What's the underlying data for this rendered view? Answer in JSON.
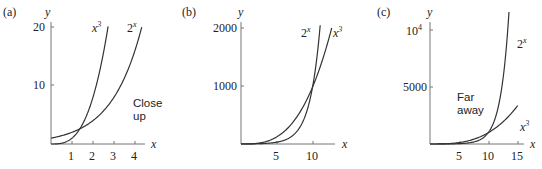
{
  "chart_data": [
    {
      "type": "line",
      "panel_label": "(a)",
      "title": "",
      "annotation": [
        "Close",
        "up"
      ],
      "xlabel": "x",
      "ylabel": "y",
      "xlim": [
        0,
        4.3
      ],
      "ylim": [
        0,
        20
      ],
      "xticks": [
        1,
        2,
        3,
        4
      ],
      "yticks": [
        10,
        20
      ],
      "series": [
        {
          "name": "x^3",
          "label": "x³",
          "function": "x^3"
        },
        {
          "name": "2^x",
          "label": "2ˣ",
          "function": "2^x"
        }
      ]
    },
    {
      "type": "line",
      "panel_label": "(b)",
      "title": "",
      "xlabel": "x",
      "ylabel": "y",
      "xlim": [
        0,
        14
      ],
      "ylim": [
        0,
        2000
      ],
      "xticks": [
        5,
        10
      ],
      "yticks": [
        1000,
        2000
      ],
      "series": [
        {
          "name": "2^x",
          "label": "2ˣ",
          "function": "2^x"
        },
        {
          "name": "x^3",
          "label": "x³",
          "function": "x^3"
        }
      ]
    },
    {
      "type": "line",
      "panel_label": "(c)",
      "title": "",
      "annotation": [
        "Far",
        "away"
      ],
      "xlabel": "x",
      "ylabel": "y",
      "xlim": [
        0,
        16
      ],
      "ylim": [
        0,
        10000
      ],
      "xticks": [
        5,
        10,
        15
      ],
      "yticks": [
        5000,
        10000
      ],
      "ytick_labels": [
        "5000",
        "10⁴"
      ],
      "series": [
        {
          "name": "2^x",
          "label": "2ˣ",
          "function": "2^x"
        },
        {
          "name": "x^3",
          "label": "x³",
          "function": "x^3"
        }
      ]
    }
  ],
  "panels": {
    "a": {
      "label": "(a)",
      "xlabel": "x",
      "ylabel": "y",
      "y20": "20",
      "y10": "10",
      "x1": "1",
      "x2": "2",
      "x3": "3",
      "x4": "4",
      "cube": "x",
      "cube_exp": "3",
      "exp": "2",
      "exp_sup": "x",
      "note1": "Close",
      "note2": "up"
    },
    "b": {
      "label": "(b)",
      "xlabel": "x",
      "ylabel": "y",
      "y2000": "2000",
      "y1000": "1000",
      "x5": "5",
      "x10": "10",
      "cube": "x",
      "cube_exp": "3",
      "exp": "2",
      "exp_sup": "x"
    },
    "c": {
      "label": "(c)",
      "xlabel": "x",
      "ylabel": "y",
      "y10k": "10",
      "y10k_exp": "4",
      "y5000": "5000",
      "x5": "5",
      "x10": "10",
      "x15": "15",
      "cube": "x",
      "cube_exp": "3",
      "exp": "2",
      "exp_sup": "x",
      "note1": "Far",
      "note2": "away"
    }
  }
}
